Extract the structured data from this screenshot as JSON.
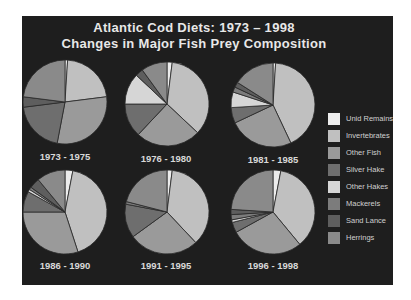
{
  "title": {
    "line1": "Atlantic Cod Diets:  1973 – 1998",
    "line2": "Changes in Major Fish Prey Composition"
  },
  "legend": [
    {
      "label": "Unid Remains",
      "color": "#ececec"
    },
    {
      "label": "Invertebrates",
      "color": "#c0c0c0"
    },
    {
      "label": "Other Fish",
      "color": "#9a9a9a"
    },
    {
      "label": "Silver Hake",
      "color": "#6e6e6e"
    },
    {
      "label": "Other Hakes",
      "color": "#d6d6d6"
    },
    {
      "label": "Mackerels",
      "color": "#7c7c7c"
    },
    {
      "label": "Sand Lance",
      "color": "#5e5e5e"
    },
    {
      "label": "Herrings",
      "color": "#8a8a8a"
    }
  ],
  "pies": [
    {
      "label": "1973 - 1975"
    },
    {
      "label": "1976 - 1980"
    },
    {
      "label": "1981 - 1985"
    },
    {
      "label": "1986 - 1990"
    },
    {
      "label": "1991 - 1995"
    },
    {
      "label": "1996 - 1998"
    }
  ],
  "chart_data": {
    "type": "pie",
    "legend_position": "right",
    "categories": [
      "Unid Remains",
      "Invertebrates",
      "Other Fish",
      "Silver Hake",
      "Other Hakes",
      "Mackerels",
      "Sand Lance",
      "Herrings"
    ],
    "series": [
      {
        "name": "1973 - 1975",
        "values": [
          1,
          22,
          30,
          20,
          0,
          0,
          4,
          23
        ]
      },
      {
        "name": "1976 - 1980",
        "values": [
          2,
          35,
          25,
          13,
          12,
          0,
          3,
          10
        ]
      },
      {
        "name": "1981 - 1985",
        "values": [
          1,
          42,
          25,
          6,
          6,
          2,
          2,
          16
        ]
      },
      {
        "name": "1986 - 1990",
        "values": [
          3,
          42,
          30,
          8,
          1,
          1,
          4,
          11
        ]
      },
      {
        "name": "1991 - 1995",
        "values": [
          2,
          36,
          27,
          13,
          0,
          1,
          0,
          21
        ]
      },
      {
        "name": "1996 - 1998",
        "values": [
          3,
          36,
          28,
          4,
          1,
          2,
          2,
          24
        ]
      }
    ]
  }
}
